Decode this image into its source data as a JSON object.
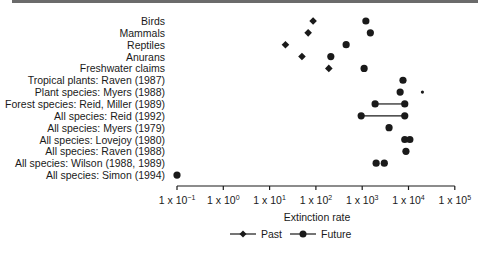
{
  "chart_data": {
    "type": "scatter",
    "title": "",
    "xlabel": "Extinction rate",
    "ylabel": "",
    "xscale": "log",
    "xlim": [
      0.1,
      100000
    ],
    "x_ticks": [
      {
        "base": "1 x 10",
        "exp": "−1"
      },
      {
        "base": "1 x 10",
        "exp": "0"
      },
      {
        "base": "1 x 10",
        "exp": "1"
      },
      {
        "base": "1 x 10",
        "exp": "2"
      },
      {
        "base": "1 x 10",
        "exp": "3"
      },
      {
        "base": "1 x 10",
        "exp": "4"
      },
      {
        "base": "1 x 10",
        "exp": "5"
      }
    ],
    "grid": false,
    "legend_position": "bottom",
    "legend": [
      {
        "name": "Past",
        "marker": "diamond"
      },
      {
        "name": "Future",
        "marker": "circle"
      }
    ],
    "categories": [
      "Birds",
      "Mammals",
      "Reptiles",
      "Anurans",
      "Freshwater claims",
      "Tropical plants: Raven (1987)",
      "Plant species: Myers (1988)",
      "Forest species: Reid, Miller (1989)",
      "All species: Reid (1992)",
      "All species: Myers (1979)",
      "All species: Lovejoy (1980)",
      "All species: Raven (1988)",
      "All species: Wilson (1988, 1989)",
      "All species: Simon (1994)"
    ],
    "series": [
      {
        "name": "Past",
        "marker": "diamond",
        "values": [
          87,
          68,
          22,
          50,
          190,
          null,
          null,
          null,
          null,
          null,
          null,
          null,
          null,
          null
        ]
      },
      {
        "name": "Future",
        "marker": "circle",
        "values": [
          [
            1200
          ],
          [
            1500
          ],
          [
            450
          ],
          [
            210
          ],
          [
            1100
          ],
          [
            7600
          ],
          [
            6600,
            20000
          ],
          [
            1900,
            8300
          ],
          [
            950,
            8300
          ],
          [
            3800
          ],
          [
            8300,
            10700
          ],
          [
            8800
          ],
          [
            2000,
            3000
          ],
          [
            0.1
          ]
        ],
        "ranges_connected": [
          false,
          false,
          false,
          false,
          false,
          false,
          false,
          true,
          true,
          false,
          false,
          false,
          false,
          false
        ]
      }
    ]
  }
}
